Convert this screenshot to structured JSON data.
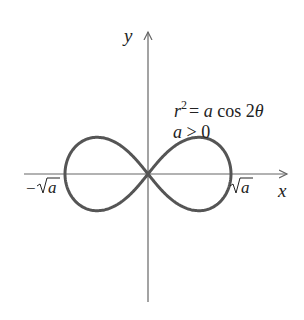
{
  "diagram": {
    "axes": {
      "x_label": "x",
      "y_label": "y"
    },
    "equation": {
      "r_var": "r",
      "exponent": "2",
      "rhs": "= a cos 2θ",
      "rhs_a": "a",
      "rhs_cos": "cos 2",
      "rhs_theta": "θ",
      "condition": "a > 0",
      "cond_a": "a",
      "cond_rest": " > 0"
    },
    "intercepts": {
      "left_minus": "−",
      "left_a": "a",
      "right_a": "a"
    },
    "colors": {
      "curve": "#555555",
      "axis": "#666666",
      "text": "#222222"
    }
  }
}
